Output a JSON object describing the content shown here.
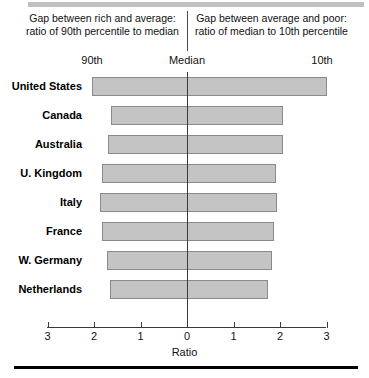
{
  "header": {
    "left_caption": "Gap between rich and average: ratio of 90th percentile to median",
    "right_caption": "Gap between average and poor: ratio of median to 10th percentile"
  },
  "top_axis": {
    "left_label": "90th",
    "center_label": "Median",
    "right_label": "10th"
  },
  "colors": {
    "bar_fill": "#c4c4c4",
    "bar_border": "#8a8a8a",
    "axis": "#3a3a3a",
    "text": "#111111",
    "top_rule": "#c0c0c0",
    "bottom_rule": "#000000"
  },
  "chart_data": {
    "type": "bar",
    "orientation": "horizontal-diverging",
    "title": "",
    "subtitle": "",
    "xlabel": "Ratio",
    "ylabel": "",
    "xlim": [
      -3,
      3
    ],
    "grid": false,
    "legend": "none",
    "center_value": 0,
    "xtick_values": [
      -3,
      -2,
      -1,
      0,
      1,
      2,
      3
    ],
    "xtick_labels": [
      "3",
      "2",
      "1",
      "0",
      "1",
      "2",
      "3"
    ],
    "categories": [
      "United States",
      "Canada",
      "Australia",
      "U. Kingdom",
      "Italy",
      "France",
      "W. Germany",
      "Netherlands"
    ],
    "series": [
      {
        "name": "ratio of 90th percentile to median",
        "side": "left",
        "values": [
          2.04,
          1.63,
          1.7,
          1.83,
          1.87,
          1.83,
          1.72,
          1.66
        ]
      },
      {
        "name": "ratio of median to 10th percentile",
        "side": "right",
        "values": [
          3.01,
          2.06,
          2.06,
          1.91,
          1.94,
          1.87,
          1.83,
          1.74
        ]
      }
    ],
    "annotations": [
      "Gap between rich and average: ratio of 90th percentile to median",
      "Gap between average and poor: ratio of median to 10th percentile",
      "90th",
      "Median",
      "10th"
    ]
  }
}
